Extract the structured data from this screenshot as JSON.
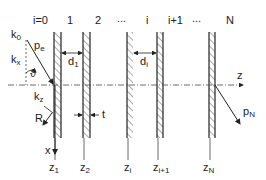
{
  "diagram": {
    "layer_indices": [
      "i=0",
      "1",
      "2",
      "...",
      "i",
      "i+1",
      "...",
      "N"
    ],
    "wave_vectors": {
      "k0": "k",
      "k0_sub": "0",
      "kx": "k",
      "kx_sub": "x",
      "kz": "k",
      "kz_sub": "z",
      "pe": "p",
      "pe_sub": "e",
      "pN": "p",
      "pN_sub": "N",
      "angle": "ϑ",
      "reflected": "R"
    },
    "dimensions": {
      "d1": "d",
      "d1_sub": "1",
      "di": "d",
      "di_sub": "i",
      "thickness": "t"
    },
    "axes": {
      "z": "z",
      "x": "x"
    },
    "positions": [
      {
        "label": "z",
        "sub": "1"
      },
      {
        "label": "z",
        "sub": "2"
      },
      {
        "label": "z",
        "sub": "i"
      },
      {
        "label": "z",
        "sub": "i+1"
      },
      {
        "label": "z",
        "sub": "N"
      }
    ],
    "colors": {
      "line": "#222222",
      "hatch": "#555555"
    }
  }
}
